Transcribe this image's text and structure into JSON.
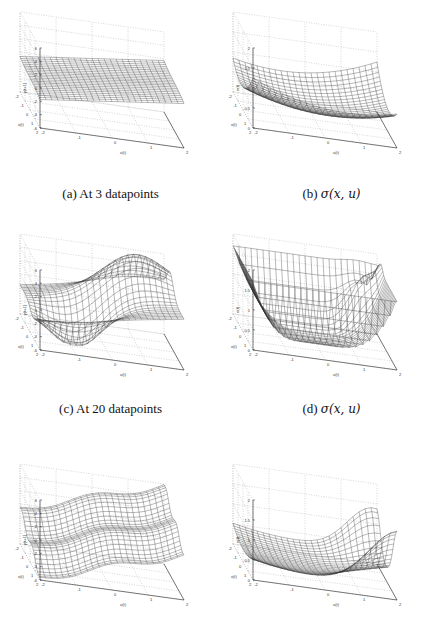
{
  "figure": {
    "panels": [
      {
        "id": "a",
        "caption_prefix": "(a) ",
        "caption_text": "At 3 datapoints",
        "caption_math": "",
        "zlabel": "y(t+1)",
        "zticks": [
          "6",
          "4",
          "2",
          "0",
          "-2",
          "-4",
          "-6"
        ]
      },
      {
        "id": "b",
        "caption_prefix": "(b) ",
        "caption_text": "",
        "caption_math": "σ(x, u)",
        "zlabel": "σ(t)",
        "zticks": [
          "2",
          "1.5",
          "1",
          "0.5",
          "0"
        ]
      },
      {
        "id": "c",
        "caption_prefix": "(c) ",
        "caption_text": "At 20 datapoints",
        "caption_math": "",
        "zlabel": "y(t+1)",
        "zticks": [
          "6",
          "4",
          "2",
          "0",
          "-2",
          "-4",
          "-6"
        ]
      },
      {
        "id": "d",
        "caption_prefix": "(d) ",
        "caption_text": "",
        "caption_math": "σ(x, u)",
        "zlabel": "σ(t)",
        "zticks": [
          "2",
          "1.5",
          "1",
          "0.5",
          "0"
        ]
      },
      {
        "id": "e",
        "caption_prefix": "",
        "caption_text": "",
        "caption_math": "",
        "zlabel": "y(t+1)",
        "zticks": [
          "6",
          "4",
          "2",
          "0",
          "-2",
          "-4",
          "-6"
        ]
      },
      {
        "id": "f",
        "caption_prefix": "",
        "caption_text": "",
        "caption_math": "",
        "zlabel": "σ(t)",
        "zticks": [
          "2",
          "1.5",
          "1",
          "0.5",
          "0"
        ]
      }
    ],
    "xlabel": "x(t)",
    "ylabel": "u(t)",
    "xticks": [
      "2",
      "1",
      "0",
      "-1",
      "-2"
    ],
    "yticks": [
      "-2",
      "-1",
      "0",
      "1",
      "2"
    ]
  },
  "chart_data": [
    {
      "type": "surface",
      "panel": "a",
      "title": "(a) At 3 datapoints",
      "xlabel": "x(t)",
      "ylabel": "u(t)",
      "zlabel": "y(t+1)",
      "xlim": [
        -2,
        2
      ],
      "ylim": [
        -2,
        2
      ],
      "zlim": [
        -6,
        6
      ],
      "description": "Nearly planar mesh surface, slightly tilted, values roughly between -2 and 2"
    },
    {
      "type": "surface",
      "panel": "b",
      "title": "(b) σ(x,u)",
      "xlabel": "x(t)",
      "ylabel": "u(t)",
      "zlabel": "σ(t)",
      "xlim": [
        -2,
        2
      ],
      "ylim": [
        -2,
        2
      ],
      "zlim": [
        0,
        2
      ],
      "description": "Saddle-like variance surface, low (~0.3) in center, rising to ~0.8-1 at corners"
    },
    {
      "type": "surface",
      "panel": "c",
      "title": "(c) At 20 datapoints",
      "xlabel": "x(t)",
      "ylabel": "u(t)",
      "zlabel": "y(t+1)",
      "xlim": [
        -2,
        2
      ],
      "ylim": [
        -2,
        2
      ],
      "zlim": [
        -6,
        6
      ],
      "description": "Mesh with a ridge peaking ~6+ and a trough down to ~-6"
    },
    {
      "type": "surface",
      "panel": "d",
      "title": "(d) σ(x,u)",
      "xlabel": "x(t)",
      "ylabel": "u(t)",
      "zlabel": "σ(t)",
      "xlim": [
        -2,
        2
      ],
      "ylim": [
        -2,
        2
      ],
      "zlim": [
        0,
        2
      ],
      "description": "Variance near 0 in data region, steeply rising above 2 at corners"
    },
    {
      "type": "surface",
      "panel": "e",
      "title": "",
      "xlabel": "x(t)",
      "ylabel": "u(t)",
      "zlabel": "y(t+1)",
      "xlim": [
        -2,
        2
      ],
      "ylim": [
        -2,
        2
      ],
      "zlim": [
        -6,
        6
      ],
      "description": "Wavy tilted mesh surface from ~6 down to ~-6"
    },
    {
      "type": "surface",
      "panel": "f",
      "title": "",
      "xlabel": "x(t)",
      "ylabel": "u(t)",
      "zlabel": "σ(t)",
      "xlim": [
        -2,
        2
      ],
      "ylim": [
        -2,
        2
      ],
      "zlim": [
        0,
        2
      ],
      "description": "Variance low (~0.1-0.3) over most area, rising to ~1.5 at back corners"
    }
  ]
}
